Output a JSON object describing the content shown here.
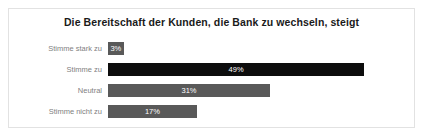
{
  "chart_data": {
    "type": "bar",
    "orientation": "horizontal",
    "title": "Die Bereitschaft der Kunden, die Bank zu wechseln, steigt",
    "xlabel": "",
    "ylabel": "",
    "categories": [
      "Stimme stark zu",
      "Stimme zu",
      "Neutral",
      "Stimme nicht zu"
    ],
    "values": [
      3,
      49,
      31,
      17
    ],
    "value_labels": [
      "3%",
      "49%",
      "31%",
      "17%"
    ],
    "bar_colors": [
      "#595959",
      "#0d0d0d",
      "#595959",
      "#595959"
    ],
    "value_label_color": "#ffffff",
    "category_label_color": "#7f7f7f",
    "xlim": [
      0,
      57
    ],
    "grid": false,
    "legend": false,
    "axis_visible": false
  },
  "card": {
    "border_color": "#e2e2e2",
    "background": "#ffffff"
  }
}
